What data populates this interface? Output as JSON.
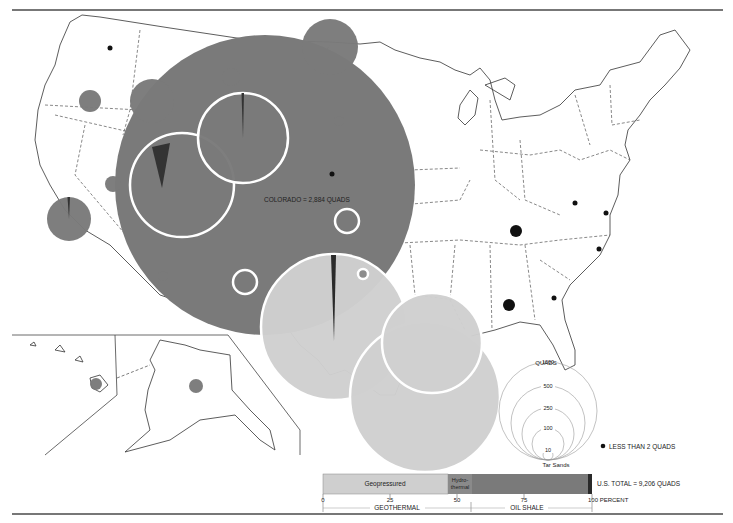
{
  "map": {
    "title_annotation": "COLORADO = 2,884 QUADS",
    "colors": {
      "geopressured": "#cfcfcf",
      "hydrothermal": "#8a8a8a",
      "oil_shale": "#7a7a7a",
      "tar_sands": "#2a2a2a",
      "small_dot": "#111111",
      "white_ring": "#ffffff"
    },
    "bubbles": [
      {
        "id": "colorado",
        "cx": 265,
        "cy": 185,
        "r": 150,
        "fill": "#7a7a7a",
        "ring": false,
        "label": "Colorado"
      },
      {
        "id": "utah",
        "cx": 182,
        "cy": 185,
        "r": 52,
        "fill": "#7a7a7a",
        "ring": true,
        "wedge": "tar"
      },
      {
        "id": "wyoming",
        "cx": 243,
        "cy": 138,
        "r": 45,
        "fill": "#7a7a7a",
        "ring": true,
        "wedge": "thin"
      },
      {
        "id": "north-dakota",
        "cx": 330,
        "cy": 47,
        "r": 28,
        "fill": "#7a7a7a",
        "ring": false
      },
      {
        "id": "idaho",
        "cx": 152,
        "cy": 101,
        "r": 22,
        "fill": "#7a7a7a",
        "ring": false
      },
      {
        "id": "oregon",
        "cx": 90,
        "cy": 101,
        "r": 11,
        "fill": "#7a7a7a",
        "ring": false
      },
      {
        "id": "montana",
        "cx": 231,
        "cy": 77,
        "r": 9,
        "fill": "#7a7a7a",
        "ring": false
      },
      {
        "id": "nevada",
        "cx": 113,
        "cy": 184,
        "r": 8,
        "fill": "#7a7a7a",
        "ring": false
      },
      {
        "id": "california",
        "cx": 69,
        "cy": 219,
        "r": 22,
        "fill": "#7a7a7a",
        "ring": false,
        "wedge": "thin"
      },
      {
        "id": "south-dakota",
        "cx": 339,
        "cy": 121,
        "r": 5,
        "fill": "#7a7a7a",
        "ring": false
      },
      {
        "id": "arizona",
        "cx": 163,
        "cy": 276,
        "r": 5,
        "fill": "#7a7a7a",
        "ring": false
      },
      {
        "id": "kansas",
        "cx": 347,
        "cy": 221,
        "r": 12,
        "fill": "#7a7a7a",
        "ring": true
      },
      {
        "id": "new-mexico",
        "cx": 245,
        "cy": 282,
        "r": 12,
        "fill": "#7a7a7a",
        "ring": true
      },
      {
        "id": "texas",
        "cx": 334,
        "cy": 327,
        "r": 73,
        "fill": "#cfcfcf",
        "ring": true,
        "wedge": "thin-dark"
      },
      {
        "id": "gulf-texas",
        "cx": 425,
        "cy": 397,
        "r": 75,
        "fill": "#cfcfcf",
        "ring": true
      },
      {
        "id": "louisiana",
        "cx": 432,
        "cy": 343,
        "r": 50,
        "fill": "#cfcfcf",
        "ring": true
      },
      {
        "id": "oklahoma",
        "cx": 363,
        "cy": 274,
        "r": 5,
        "fill": "#8a8a8a",
        "ring": true
      },
      {
        "id": "hawaii",
        "cx": 96,
        "cy": 384,
        "r": 6,
        "fill": "#7a7a7a",
        "ring": false
      },
      {
        "id": "alaska",
        "cx": 196,
        "cy": 386,
        "r": 7,
        "fill": "#7a7a7a",
        "ring": false
      }
    ],
    "small_dots": [
      {
        "id": "washington",
        "cx": 110,
        "cy": 48,
        "r": 2.5
      },
      {
        "id": "nebraska",
        "cx": 332,
        "cy": 174,
        "r": 2.5
      },
      {
        "id": "west-virginia",
        "cx": 575,
        "cy": 203,
        "r": 2.5
      },
      {
        "id": "virginia",
        "cx": 606,
        "cy": 213,
        "r": 2.5
      },
      {
        "id": "north-carolina",
        "cx": 599,
        "cy": 249,
        "r": 2.5
      },
      {
        "id": "georgia",
        "cx": 554,
        "cy": 298,
        "r": 2.5
      }
    ],
    "large_dots": [
      {
        "id": "kentucky",
        "cx": 516,
        "cy": 231,
        "r": 6
      },
      {
        "id": "alabama",
        "cx": 509,
        "cy": 305,
        "r": 6
      }
    ]
  },
  "legend": {
    "size_scale": {
      "unit": "QUADS",
      "circles": [
        {
          "value": "1000",
          "r": 49
        },
        {
          "value": "500",
          "r": 37
        },
        {
          "value": "250",
          "r": 26
        },
        {
          "value": "100",
          "r": 16
        },
        {
          "value": "10",
          "r": 5
        }
      ],
      "tar_sands_label": "Tar Sands"
    },
    "less_than_label": "LESS THAN 2 QUADS"
  },
  "chart_data": {
    "type": "bar",
    "title": "U.S. TOTAL = 9,206 QUADS",
    "orientation": "horizontal-stacked",
    "xlabel": "PERCENT",
    "x_ticks": [
      "0",
      "25",
      "50",
      "75",
      "100"
    ],
    "xlim": [
      0,
      100
    ],
    "segments": [
      {
        "name": "Geopressured",
        "start": 0,
        "end": 45.5,
        "color": "#cfcfcf",
        "group": "GEOTHERMAL"
      },
      {
        "name": "Hydrothermal",
        "start": 45.5,
        "end": 54.5,
        "color": "#8a8a8a",
        "group": "GEOTHERMAL"
      },
      {
        "name": "Oil Shale",
        "start": 54.5,
        "end": 98.5,
        "color": "#7a7a7a",
        "group": "OIL SHALE"
      },
      {
        "name": "Tar Sands",
        "start": 98.5,
        "end": 100,
        "color": "#2a2a2a",
        "group": "OIL SHALE"
      }
    ],
    "groups": [
      {
        "name": "GEOTHERMAL",
        "start": 0,
        "end": 54.5
      },
      {
        "name": "OIL SHALE",
        "start": 54.5,
        "end": 100
      }
    ]
  },
  "bar": {
    "geopressured_label": "Geopressured",
    "hydro_label_1": "Hydro-",
    "hydro_label_2": "thermal",
    "total_label": "U.S. TOTAL = 9,206 QUADS",
    "tick_0": "0",
    "tick_25": "25",
    "tick_50": "50",
    "tick_75": "75",
    "tick_100": "100 PERCENT",
    "group_geothermal": "GEOTHERMAL",
    "group_oil_shale": "OIL SHALE"
  }
}
